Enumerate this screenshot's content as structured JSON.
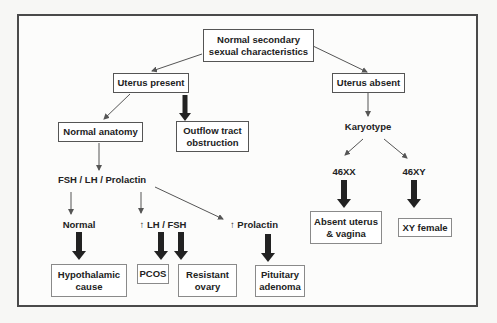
{
  "diagram": {
    "nodes": {
      "root": "Normal secondary\nsexual characteristics",
      "uterus_present": "Uterus present",
      "uterus_absent": "Uterus absent",
      "normal_anatomy": "Normal anatomy",
      "outflow": "Outflow tract\nobstruction",
      "hormones": "FSH / LH / Prolactin",
      "normal": "Normal",
      "high_lh_fsh": "↑ LH / FSH",
      "high_prolactin": "↑ Prolactin",
      "hypothalamic": "Hypothalamic\ncause",
      "pcos": "PCOS",
      "resistant_ovary": "Resistant\novary",
      "pituitary": "Pituitary\nadenoma",
      "karyotype": "Karyotype",
      "xx": "46XX",
      "xy": "46XY",
      "absent_uterus_vagina": "Absent uterus\n& vagina",
      "xy_female": "XY female"
    },
    "edges": [
      {
        "from": "root",
        "to": "uterus_present",
        "style": "thin"
      },
      {
        "from": "root",
        "to": "uterus_absent",
        "style": "thin"
      },
      {
        "from": "uterus_present",
        "to": "normal_anatomy",
        "style": "thin"
      },
      {
        "from": "uterus_present",
        "to": "outflow",
        "style": "thick"
      },
      {
        "from": "normal_anatomy",
        "to": "hormones",
        "style": "thin"
      },
      {
        "from": "hormones",
        "to": "normal",
        "style": "thin"
      },
      {
        "from": "hormones",
        "to": "high_lh_fsh",
        "style": "thin"
      },
      {
        "from": "hormones",
        "to": "high_prolactin",
        "style": "thin"
      },
      {
        "from": "normal",
        "to": "hypothalamic",
        "style": "thick"
      },
      {
        "from": "high_lh_fsh",
        "to": "pcos",
        "style": "thick"
      },
      {
        "from": "high_lh_fsh",
        "to": "resistant_ovary",
        "style": "thick"
      },
      {
        "from": "high_prolactin",
        "to": "pituitary",
        "style": "thick"
      },
      {
        "from": "uterus_absent",
        "to": "karyotype",
        "style": "thin"
      },
      {
        "from": "karyotype",
        "to": "xx",
        "style": "thin"
      },
      {
        "from": "karyotype",
        "to": "xy",
        "style": "thin"
      },
      {
        "from": "xx",
        "to": "absent_uterus_vagina",
        "style": "thick"
      },
      {
        "from": "xy",
        "to": "xy_female",
        "style": "thick"
      }
    ],
    "colors": {
      "line": "#555555",
      "thick_arrow": "#222222",
      "frame": "#4a4a4a"
    }
  }
}
